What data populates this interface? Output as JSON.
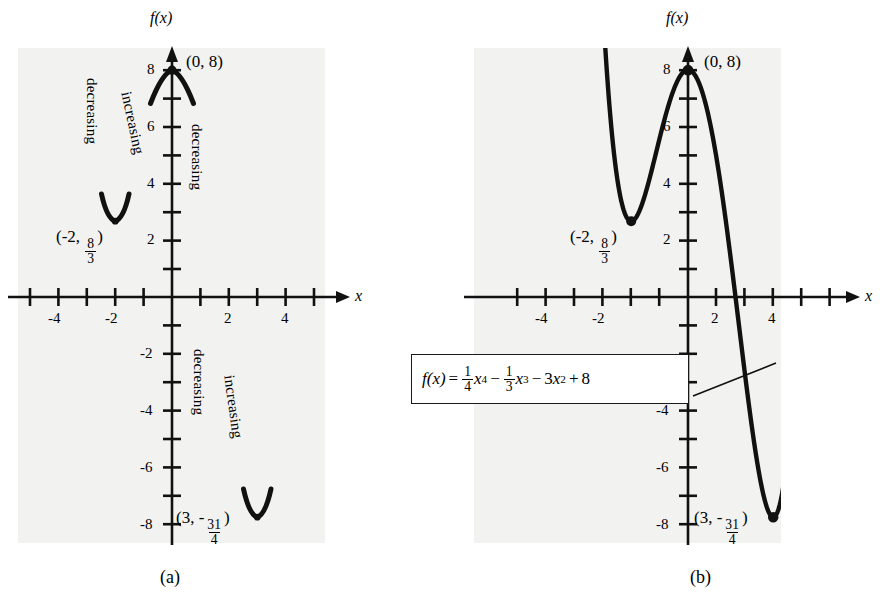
{
  "figure": {
    "axis_label_y": "f(x)",
    "axis_label_x": "x",
    "background_color": "#f2f2f0",
    "curve_color": "#111111"
  },
  "chart_data": {
    "type": "line",
    "xlabel": "x",
    "ylabel": "f(x)",
    "xlim": [
      -5.5,
      5.5
    ],
    "ylim": [
      -9,
      9
    ],
    "x_ticks": [
      -5,
      -4,
      -3,
      -2,
      -1,
      1,
      2,
      3,
      4,
      5
    ],
    "x_tick_labels": [
      "-4",
      "-2",
      "2",
      "4"
    ],
    "x_tick_labels_at": [
      -4,
      -2,
      2,
      4
    ],
    "y_ticks": [
      -8,
      -7,
      -6,
      -5,
      -4,
      -3,
      -2,
      -1,
      1,
      2,
      3,
      4,
      5,
      6,
      7,
      8
    ],
    "y_tick_labels": [
      "8",
      "6",
      "4",
      "2",
      "-2",
      "-4",
      "-6",
      "-8"
    ],
    "y_tick_labels_at": [
      8,
      6,
      4,
      2,
      -2,
      -4,
      -6,
      -8
    ],
    "grid": false,
    "legend": false,
    "equation_coefficients": {
      "x4": 0.25,
      "x3": -0.3333333333,
      "x2": -3,
      "x1": 0,
      "x0": 8
    },
    "critical_points": [
      {
        "label": "(-2, 8/3)",
        "x": -2,
        "y": 2.6667,
        "kind": "local minimum"
      },
      {
        "label": "(0, 8)",
        "x": 0,
        "y": 8,
        "kind": "local maximum"
      },
      {
        "label": "(3, -31/4)",
        "x": 3,
        "y": -7.75,
        "kind": "local minimum"
      }
    ],
    "intervals": [
      {
        "label": "decreasing",
        "interval": "(-inf, -2)"
      },
      {
        "label": "increasing",
        "interval": "(-2, 0)"
      },
      {
        "label": "decreasing",
        "interval": "(0, 3)"
      },
      {
        "label": "increasing",
        "interval": "(3, inf)"
      }
    ],
    "series": [
      {
        "name": "f(x)",
        "x": [
          -3.45,
          -3.3,
          -3.1,
          -2.9,
          -2.7,
          -2.5,
          -2.3,
          -2.1,
          -2.0,
          -1.9,
          -1.7,
          -1.5,
          -1.3,
          -1.1,
          -0.9,
          -0.7,
          -0.5,
          -0.3,
          -0.1,
          0,
          0.1,
          0.3,
          0.5,
          0.7,
          0.9,
          1.1,
          1.3,
          1.5,
          1.7,
          1.9,
          2.1,
          2.3,
          2.5,
          2.7,
          2.9,
          3.0,
          3.1,
          3.3,
          3.5,
          3.7,
          3.9,
          4.1,
          4.2,
          4.3,
          4.4
        ],
        "y": [
          12.55,
          10.21,
          7.49,
          5.29,
          3.66,
          2.6,
          2.12,
          2.2,
          2.67,
          2.54,
          3.15,
          3.88,
          4.73,
          5.63,
          6.51,
          7.29,
          7.9,
          8.27,
          8.36,
          8.0,
          8.36,
          8.25,
          7.86,
          7.2,
          6.32,
          5.26,
          4.06,
          2.78,
          1.48,
          0.23,
          -0.9,
          -1.86,
          -2.6,
          -3.06,
          -3.22,
          -7.75,
          -3.14,
          -2.53,
          -1.26,
          0.88,
          4.03,
          8.4,
          11.1,
          14.2,
          17.7
        ]
      }
    ]
  },
  "panel_a": {
    "caption": "(a)",
    "axis_label_y": "f(x)",
    "axis_label_x": "x",
    "x_tick_labels": [
      "-4",
      "-2",
      "2",
      "4"
    ],
    "y_tick_labels": [
      "8",
      "6",
      "4",
      "2",
      "-2",
      "-4",
      "-6",
      "-8"
    ],
    "point_labels": {
      "local_max": "(0, 8)",
      "local_min_left_x": "(-2, ",
      "local_min_left_num": "8",
      "local_min_left_den": "3",
      "local_min_left_close": ")",
      "local_min_right_x": "(3, -",
      "local_min_right_num": "31",
      "local_min_right_den": "4",
      "local_min_right_close": ")"
    },
    "annotations": [
      "decreasing",
      "increasing",
      "decreasing",
      "decreasing",
      "increasing"
    ]
  },
  "panel_b": {
    "caption": "(b)",
    "axis_label_y": "f(x)",
    "axis_label_x": "x",
    "x_tick_labels": [
      "-4",
      "-2",
      "2",
      "4"
    ],
    "y_tick_labels": [
      "8",
      "6",
      "4",
      "2",
      "-4",
      "-6",
      "-8"
    ],
    "point_labels": {
      "local_max": "(0, 8)",
      "local_min_left_x": "(-2, ",
      "local_min_left_num": "8",
      "local_min_left_den": "3",
      "local_min_left_close": ")",
      "local_min_right_x": "(3, -",
      "local_min_right_num": "31",
      "local_min_right_den": "4",
      "local_min_right_close": ")"
    },
    "equation": {
      "lhs": "f(x)",
      "equals": "=",
      "t1_num": "1",
      "t1_den": "4",
      "t1_var": "x",
      "t1_pow": "4",
      "op1": "−",
      "t2_num": "1",
      "t2_den": "3",
      "t2_var": "x",
      "t2_pow": "3",
      "op2": "−",
      "t3_coef": "3",
      "t3_var": "x",
      "t3_pow": "2",
      "op3": "+",
      "t4": "8",
      "plain": "f(x) = 1/4 x^4 - 1/3 x^3 - 3x^2 + 8"
    }
  }
}
